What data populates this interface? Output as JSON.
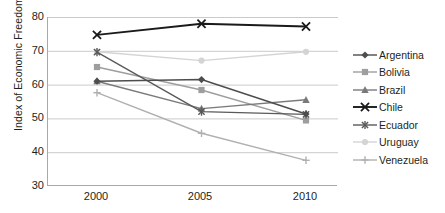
{
  "chart_data": {
    "type": "line",
    "title": "",
    "xlabel": "",
    "ylabel": "Index of Economic Freedom",
    "categories": [
      "2000",
      "2005",
      "2010"
    ],
    "x": [
      2000,
      2005,
      2010
    ],
    "ylim": [
      30,
      80
    ],
    "yticks": [
      30,
      40,
      50,
      60,
      70,
      80
    ],
    "xlim": [
      2000,
      2010
    ],
    "grid": "horizontal",
    "legend_position": "right",
    "series": [
      {
        "name": "Argentina",
        "values": [
          61.0,
          61.5,
          51.3
        ],
        "color": "#4d4d4d",
        "marker": "diamond"
      },
      {
        "name": "Bolivia",
        "values": [
          65.2,
          58.4,
          49.4
        ],
        "color": "#9e9e9e",
        "marker": "square"
      },
      {
        "name": "Brazil",
        "values": [
          61.0,
          52.9,
          55.5
        ],
        "color": "#7a7a7a",
        "marker": "triangle"
      },
      {
        "name": "Chile",
        "values": [
          74.7,
          78.0,
          77.2
        ],
        "color": "#1a1a1a",
        "marker": "x"
      },
      {
        "name": "Ecuador",
        "values": [
          69.6,
          52.0,
          51.2
        ],
        "color": "#5a5a5a",
        "marker": "star"
      },
      {
        "name": "Uruguay",
        "values": [
          69.7,
          67.1,
          69.7
        ],
        "color": "#d4d4d4",
        "marker": "circle"
      },
      {
        "name": "Venezuela",
        "values": [
          57.6,
          45.6,
          37.6
        ],
        "color": "#b0b0b0",
        "marker": "plus"
      }
    ]
  },
  "axis": {
    "y_title": "Index of Economic Freedom",
    "y_tick_labels": [
      "80",
      "70",
      "60",
      "50",
      "40",
      "30"
    ],
    "x_tick_labels": [
      "2000",
      "2005",
      "2010"
    ]
  },
  "legend": {
    "entries": [
      {
        "label": "Argentina"
      },
      {
        "label": "Bolivia"
      },
      {
        "label": "Brazil"
      },
      {
        "label": "Chile"
      },
      {
        "label": "Ecuador"
      },
      {
        "label": "Uruguay"
      },
      {
        "label": "Venezuela"
      }
    ]
  },
  "colors": {
    "background": "#ffffff",
    "axis": "#a7a9ac",
    "grid": "#c9cacc",
    "text": "#231f20"
  }
}
